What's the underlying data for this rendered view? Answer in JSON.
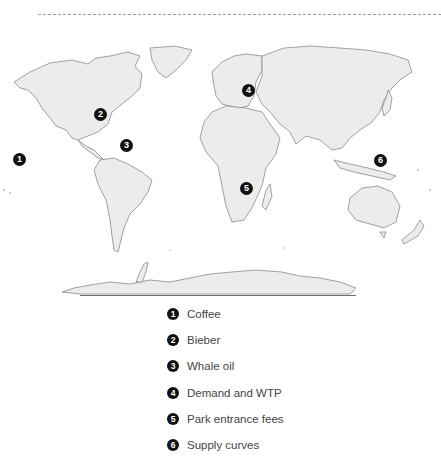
{
  "map": {
    "type": "world-outline-map",
    "land_color": "#ececec",
    "outline_color": "#8a8a8a",
    "marker_color": "#111111",
    "markers": [
      {
        "num": "1",
        "x": 8,
        "y": 153,
        "region": "west coast of North America"
      },
      {
        "num": "2",
        "x": 99,
        "y": 87,
        "region": "Great Lakes / central Canada"
      },
      {
        "num": "3",
        "x": 126,
        "y": 116,
        "region": "North Atlantic Ocean"
      },
      {
        "num": "4",
        "x": 248,
        "y": 92,
        "region": "Central Europe"
      },
      {
        "num": "5",
        "x": 244,
        "y": 190,
        "region": "Southeast Africa"
      },
      {
        "num": "6",
        "x": 380,
        "y": 162,
        "region": "Southeast Asia / Philippines"
      }
    ]
  },
  "legend": {
    "items": [
      {
        "num": "1",
        "label": "Coffee"
      },
      {
        "num": "2",
        "label": "Bieber"
      },
      {
        "num": "3",
        "label": "Whale oil"
      },
      {
        "num": "4",
        "label": "Demand and WTP"
      },
      {
        "num": "5",
        "label": "Park entrance fees"
      },
      {
        "num": "6",
        "label": "Supply curves"
      }
    ]
  }
}
